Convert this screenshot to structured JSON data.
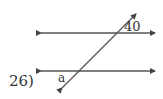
{
  "problem": {
    "number_label": "26)",
    "angle_known": "40",
    "angle_unknown": "a"
  },
  "figure": {
    "type": "parallel lines cut by transversal",
    "line_color": "#444444"
  }
}
